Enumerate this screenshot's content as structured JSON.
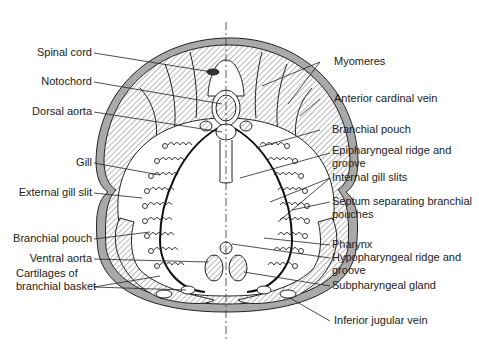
{
  "figure": {
    "colors": {
      "skin": "#a9a9a9",
      "ink": "#222222",
      "hatch": "#8a8a8a",
      "background": "#ffffff"
    }
  },
  "labels_left": [
    {
      "id": "spinal-cord",
      "text": "Spinal cord"
    },
    {
      "id": "notochord",
      "text": "Notochord"
    },
    {
      "id": "dorsal-aorta",
      "text": "Dorsal aorta"
    },
    {
      "id": "gill",
      "text": "Gill"
    },
    {
      "id": "external-gill-slit",
      "text": "External gill slit"
    },
    {
      "id": "branchial-pouch-left",
      "text": "Branchial pouch"
    },
    {
      "id": "ventral-aorta",
      "text": "Ventral aorta"
    },
    {
      "id": "cartilages-line1",
      "text": "Cartilages of"
    },
    {
      "id": "cartilages-line2",
      "text": "branchial basket"
    }
  ],
  "labels_right": [
    {
      "id": "myomeres",
      "text": "Myomeres"
    },
    {
      "id": "anterior-cardinal-vein",
      "text": "Anterior cardinal vein"
    },
    {
      "id": "branchial-pouch-right",
      "text": "Branchial pouch"
    },
    {
      "id": "epipharyngeal-line1",
      "text": "Epipharyngeal ridge and"
    },
    {
      "id": "epipharyngeal-line2",
      "text": "groove"
    },
    {
      "id": "internal-gill-slits",
      "text": "Internal gill slits"
    },
    {
      "id": "septum-line1",
      "text": "Septum separating branchial"
    },
    {
      "id": "septum-line2",
      "text": "pouches"
    },
    {
      "id": "pharynx",
      "text": "Pharynx"
    },
    {
      "id": "hypopharyngeal-line1",
      "text": "Hypopharyngeal ridge and"
    },
    {
      "id": "hypopharyngeal-line2",
      "text": "groove"
    },
    {
      "id": "subpharyngeal-gland",
      "text": "Subpharyngeal gland"
    },
    {
      "id": "inferior-jugular-vein",
      "text": "Inferior jugular vein"
    }
  ]
}
